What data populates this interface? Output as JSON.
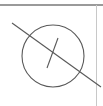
{
  "figure": {
    "type": "geometric-line-diagram",
    "canvas": {
      "width": 103,
      "height": 106,
      "background_color": "#ffffff"
    },
    "palette": {
      "stroke_color": "#595959",
      "frame_color": "#9a9a9a",
      "frame_color_light": "#c8c8c8",
      "background_color": "#ffffff"
    },
    "frame": {
      "top_rule": {
        "name": "top-border-rule",
        "x1": 0,
        "y1": 5,
        "x2": 103,
        "y2": 5,
        "color": "#9a9a9a",
        "width": 1.4
      },
      "right_rule": {
        "name": "right-border-rule",
        "x1": 96.5,
        "y1": 5,
        "x2": 96.5,
        "y2": 106,
        "color": "#c8c8c8",
        "width": 1.2
      }
    },
    "shapes": [
      {
        "name": "circle",
        "kind": "circle",
        "cx": 53,
        "cy": 56,
        "r": 31,
        "stroke": "#595959",
        "stroke_width": 1.1,
        "fill": "none"
      },
      {
        "name": "secant-diagonal-line",
        "kind": "line",
        "x1": 12,
        "y1": 23,
        "x2": 101,
        "y2": 87,
        "stroke": "#595959",
        "stroke_width": 1.1
      },
      {
        "name": "radius-segment-line",
        "kind": "line",
        "x1": 58,
        "y1": 38,
        "x2": 47,
        "y2": 68,
        "stroke": "#595959",
        "stroke_width": 1.1
      }
    ],
    "labels": []
  },
  "chart_data": {
    "type": "table",
    "categories": [
      "circle",
      "secant-diagonal-line",
      "radius-segment-line"
    ],
    "values": [
      31,
      109,
      32
    ],
    "xlabel": "element",
    "ylabel": "length (px)",
    "annotations": []
  }
}
